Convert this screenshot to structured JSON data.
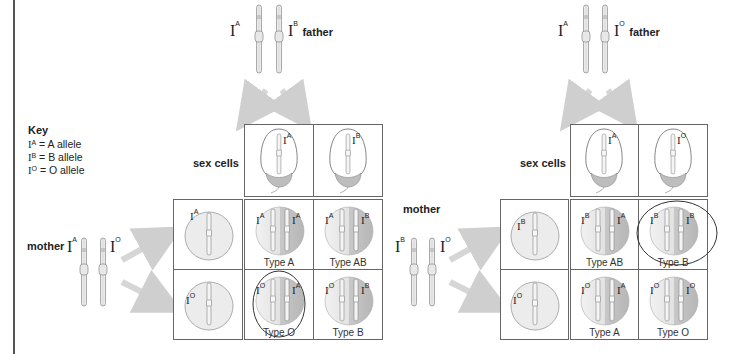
{
  "key": {
    "title": "Key",
    "items": [
      {
        "allele": "A",
        "label": "= A allele"
      },
      {
        "allele": "B",
        "label": "= B allele"
      },
      {
        "allele": "O",
        "label": "= O allele"
      }
    ]
  },
  "labels": {
    "father": "father",
    "mother": "mother",
    "sex_cells": "sex cells",
    "I": "I"
  },
  "colors": {
    "line": "#666666",
    "cell_light": "#ececec",
    "cell_dark": "#bdbdbd",
    "arrow": "#cfcfcf",
    "circle_annotation": "#333333"
  },
  "crosses": [
    {
      "father_alleles": [
        "A",
        "B"
      ],
      "mother_alleles": [
        "A",
        "O"
      ],
      "sperm": [
        "A",
        "B"
      ],
      "eggs": [
        "A",
        "O"
      ],
      "offspring": [
        [
          {
            "alleles": [
              "A",
              "A"
            ],
            "type": "Type A"
          },
          {
            "alleles": [
              "A",
              "B"
            ],
            "type": "Type AB"
          }
        ],
        [
          {
            "alleles": [
              "O",
              "A"
            ],
            "type": "Type O",
            "circled": true
          },
          {
            "alleles": [
              "O",
              "B"
            ],
            "type": "Type B"
          }
        ]
      ]
    },
    {
      "father_alleles": [
        "A",
        "O"
      ],
      "mother_alleles": [
        "B",
        "O"
      ],
      "sperm": [
        "A",
        "O"
      ],
      "eggs": [
        "B",
        "O"
      ],
      "offspring": [
        [
          {
            "alleles": [
              "B",
              "A"
            ],
            "type": "Type AB"
          },
          {
            "alleles": [
              "B",
              "B"
            ],
            "type": "Type B",
            "circled": true
          }
        ],
        [
          {
            "alleles": [
              "O",
              "A"
            ],
            "type": "Type A"
          },
          {
            "alleles": [
              "O",
              "O"
            ],
            "type": "Type O"
          }
        ]
      ]
    }
  ]
}
